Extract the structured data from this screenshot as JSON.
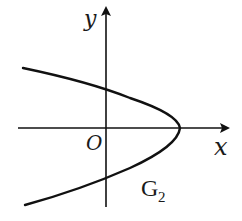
{
  "diagram": {
    "type": "coordinate-plane-parabola",
    "x_axis_label": "x",
    "y_axis_label": "y",
    "origin_label": "O",
    "curve_label_main": "G",
    "curve_label_sub": "2",
    "curve_description": "Parabola opening to the left, vertex on positive x-axis, intersecting y-axis above and below origin",
    "colors": {
      "stroke": "#111111",
      "background": "#ffffff"
    }
  }
}
